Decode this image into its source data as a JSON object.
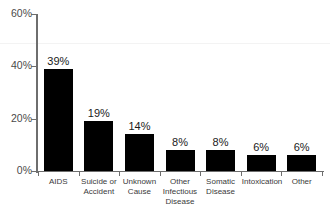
{
  "chart_data": {
    "type": "bar",
    "title": "",
    "subtitle": "",
    "xlabel": "",
    "ylabel": "",
    "ylim": [
      0,
      60
    ],
    "yticks": [
      "0%",
      "20%",
      "40%",
      "60%"
    ],
    "ytick_values": [
      0,
      20,
      40,
      60
    ],
    "grid": true,
    "gridlines": [
      50
    ],
    "legend": "none",
    "bar_color": "#000000",
    "axis_color": "#6e6e6e",
    "gridline_color": "#f3f3f3",
    "categories": [
      "AIDS",
      "Suicide or Accident",
      "Unknown Cause",
      "Other Infectious Disease",
      "Somatic Disease",
      "Intoxication",
      "Other"
    ],
    "values": [
      39,
      19,
      14,
      8,
      8,
      6,
      6
    ],
    "data_labels": [
      "39%",
      "19%",
      "14%",
      "8%",
      "8%",
      "6%",
      "6%"
    ]
  }
}
